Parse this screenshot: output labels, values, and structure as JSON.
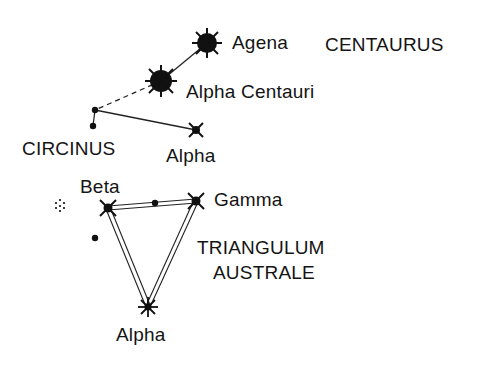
{
  "constellations": [
    {
      "name": "CENTAURUS",
      "label_pos": [
        325,
        34
      ]
    },
    {
      "name": "CIRCINUS",
      "label_pos": [
        22,
        138
      ]
    },
    {
      "name": "TRIANGULUM",
      "label_pos": [
        197,
        237
      ]
    },
    {
      "name": "AUSTRALE",
      "label_pos": [
        212,
        262
      ]
    }
  ],
  "stars": [
    {
      "name": "Agena",
      "constellation": "Centaurus",
      "type": "bright",
      "x": 207,
      "y": 43,
      "label_pos": [
        232,
        32
      ]
    },
    {
      "name": "Alpha Centauri",
      "constellation": "Centaurus",
      "type": "bright",
      "x": 161,
      "y": 81,
      "label_pos": [
        186,
        81
      ]
    },
    {
      "name": "Alpha",
      "constellation": "Circinus",
      "type": "medium",
      "x": 196,
      "y": 130,
      "label_pos": [
        166,
        145
      ]
    },
    {
      "name": "Beta",
      "constellation": "Triangulum Australe",
      "type": "medium",
      "x": 108,
      "y": 208,
      "label_pos": [
        80,
        177
      ]
    },
    {
      "name": "Gamma",
      "constellation": "Triangulum Australe",
      "type": "medium",
      "x": 196,
      "y": 201,
      "label_pos": [
        214,
        189
      ]
    },
    {
      "name": "Alpha",
      "constellation": "Triangulum Australe",
      "type": "medium",
      "x": 148,
      "y": 307,
      "label_pos": [
        116,
        325
      ]
    }
  ],
  "labels": {
    "agena": "Agena",
    "centaurus": "CENTAURUS",
    "alpha_centauri": "Alpha Centauri",
    "circinus": "CIRCINUS",
    "alpha_circinus": "Alpha",
    "beta": "Beta",
    "gamma": "Gamma",
    "triangulum": "TRIANGULUM",
    "australe": "AUSTRALE",
    "alpha_tra": "Alpha"
  }
}
